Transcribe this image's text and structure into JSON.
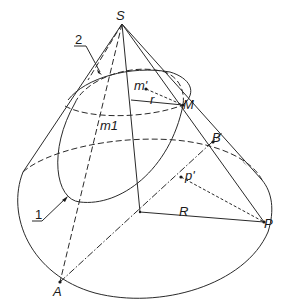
{
  "figure": {
    "type": "geometric-diagram",
    "line_color": "#2a2a2a",
    "background": "#ffffff"
  },
  "labels": {
    "apex": "S",
    "point_M": "M",
    "point_m_prime": "m'",
    "radius_small": "r",
    "point_m1": "m1",
    "point_B": "B",
    "point_p_prime": "p'",
    "radius_large": "R",
    "point_P": "P",
    "point_A": "A",
    "leader_1": "1",
    "leader_2": "2"
  }
}
